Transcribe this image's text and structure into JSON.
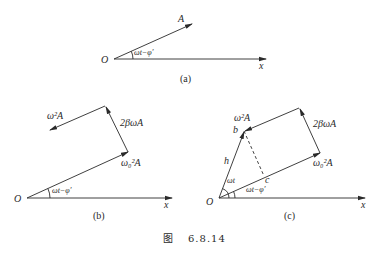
{
  "figure_caption": {
    "prefix": "图",
    "number": "6.8.14"
  },
  "panels": [
    {
      "id": "a",
      "caption": "(a)",
      "labels": {
        "origin": "O",
        "x_axis": "x",
        "vector": "A",
        "angle": "ωt−φ′"
      }
    },
    {
      "id": "b",
      "caption": "(b)",
      "labels": {
        "origin": "O",
        "x_axis": "x",
        "angle": "ωt−φ′",
        "v1": "ω₀²A",
        "v2": "2βωA",
        "v3": "ω²A"
      }
    },
    {
      "id": "c",
      "caption": "(c)",
      "labels": {
        "origin": "O",
        "x_axis": "x",
        "angle1": "ωt",
        "angle2": "ωt−φ′",
        "v1": "ω₀²A",
        "v2": "2βωA",
        "v3": "ω²A",
        "h": "h",
        "b": "b",
        "c": "c"
      }
    }
  ]
}
